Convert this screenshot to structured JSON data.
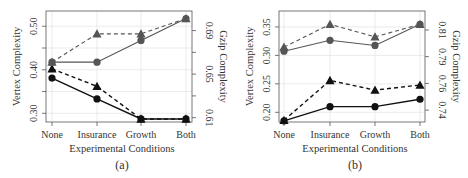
{
  "chart_data": [
    {
      "id": "a",
      "type": "line",
      "caption": "(a)",
      "xlabel": "Experimental Conditions",
      "ylabel_left": "Vertex Complexity",
      "ylabel_right": "Gzip Complexity",
      "categories": [
        "None",
        "Insurance",
        "Growth",
        "Both"
      ],
      "yticks_left": [
        0.3,
        0.35,
        0.4,
        0.45,
        0.5
      ],
      "yticklabels_left": [
        "0.30",
        "",
        "0.40",
        "",
        "0.50"
      ],
      "ylim_left": [
        0.28,
        0.535
      ],
      "yticks_right": [
        0.61,
        0.63,
        0.65,
        0.67,
        0.69
      ],
      "yticklabels_right": [
        "0.61",
        "",
        "0.65",
        "",
        "0.69"
      ],
      "ylim_right": [
        0.606,
        0.708
      ],
      "grid": true,
      "series": [
        {
          "name": "Vertex complexity (circle)",
          "axis": "left",
          "marker": "circle",
          "line": "solid",
          "values": [
            0.381,
            0.333,
            0.287,
            0.287
          ]
        },
        {
          "name": "Vertex complexity (triangle)",
          "axis": "left",
          "marker": "triangle",
          "line": "dashed",
          "values": [
            0.402,
            0.362,
            0.287,
            0.287
          ]
        },
        {
          "name": "Gzip complexity (circle)",
          "axis": "right",
          "marker": "circle",
          "line": "solid",
          "color": "#555555",
          "values": [
            0.661,
            0.661,
            0.681,
            0.701
          ]
        },
        {
          "name": "Gzip complexity (triangle)",
          "axis": "right",
          "marker": "triangle",
          "line": "dashed",
          "color": "#555555",
          "values": [
            0.661,
            0.687,
            0.687,
            0.701
          ]
        }
      ]
    },
    {
      "id": "b",
      "type": "line",
      "caption": "(b)",
      "xlabel": "Experimental Conditions",
      "ylabel_left": "Vertex Complexity",
      "ylabel_right": "Gzip Complexity",
      "categories": [
        "None",
        "Insurance",
        "Growth",
        "Both"
      ],
      "yticks_left": [
        0.2,
        0.25,
        0.3,
        0.35
      ],
      "yticklabels_left": [
        "0.20",
        "0.25",
        "0.30",
        "0.35"
      ],
      "ylim_left": [
        0.183,
        0.378
      ],
      "yticks_right": [
        0.74,
        0.7633,
        0.7867,
        0.81
      ],
      "yticklabels_right": [
        "0.74",
        "0.76",
        "0.79",
        "0.81"
      ],
      "ylim_right": [
        0.7296,
        0.8266
      ],
      "grid": true,
      "series": [
        {
          "name": "Vertex complexity (circle)",
          "axis": "left",
          "marker": "circle",
          "line": "solid",
          "values": [
            0.185,
            0.21,
            0.21,
            0.223
          ]
        },
        {
          "name": "Vertex complexity (triangle)",
          "axis": "left",
          "marker": "triangle",
          "line": "dashed",
          "values": [
            0.186,
            0.256,
            0.239,
            0.248
          ]
        },
        {
          "name": "Gzip complexity (circle)",
          "axis": "right",
          "marker": "circle",
          "line": "solid",
          "color": "#555555",
          "values": [
            0.7915,
            0.801,
            0.7965,
            0.815
          ]
        },
        {
          "name": "Gzip complexity (triangle)",
          "axis": "right",
          "marker": "triangle",
          "line": "dashed",
          "color": "#555555",
          "values": [
            0.795,
            0.815,
            0.804,
            0.815
          ]
        }
      ]
    }
  ],
  "colors": {
    "dark_series": "#111111",
    "gray_series": "#555555",
    "grid": "#e6e6e6",
    "axis": "#555555",
    "text": "#333333"
  }
}
